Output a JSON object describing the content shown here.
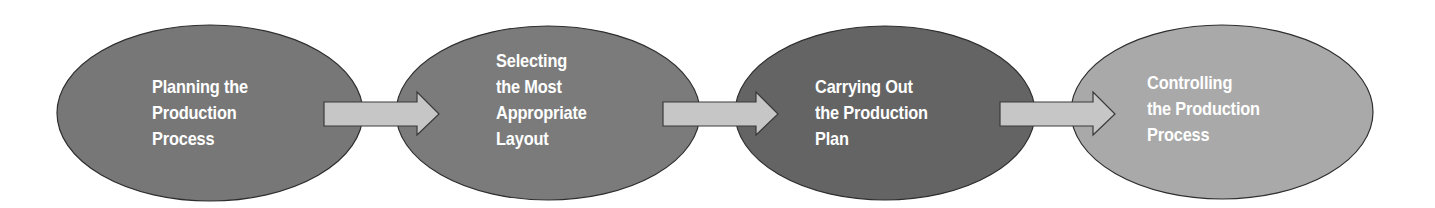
{
  "diagram": {
    "type": "process-flow",
    "background": "#ffffff",
    "arrow_fill": "#c6c6c6",
    "arrow_stroke": "#3a3a3a",
    "ellipse_stroke": "#2e2e2e",
    "steps": [
      {
        "id": "step-1",
        "lines": [
          "Planning the",
          "Production",
          "Process"
        ],
        "fill": "#777777"
      },
      {
        "id": "step-2",
        "lines": [
          "Selecting",
          "the Most",
          "Appropriate",
          "Layout"
        ],
        "fill": "#7b7b7b"
      },
      {
        "id": "step-3",
        "lines": [
          "Carrying Out",
          "the Production",
          "Plan"
        ],
        "fill": "#646464"
      },
      {
        "id": "step-4",
        "lines": [
          "Controlling",
          "the Production",
          "Process"
        ],
        "fill": "#a9a9a9"
      }
    ],
    "arrows": [
      {
        "from": "step-1",
        "to": "step-2"
      },
      {
        "from": "step-2",
        "to": "step-3"
      },
      {
        "from": "step-3",
        "to": "step-4"
      }
    ]
  }
}
